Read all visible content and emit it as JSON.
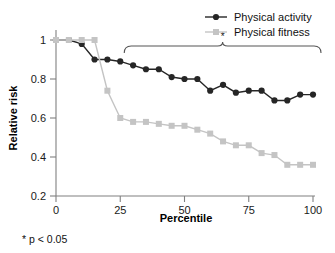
{
  "chart_data": {
    "type": "line",
    "title": "",
    "xlabel": "Percentile",
    "ylabel": "Relative risk",
    "xlim": [
      0,
      100
    ],
    "ylim": [
      0.2,
      1.0
    ],
    "xticks": [
      "0",
      "25",
      "50",
      "75",
      "100"
    ],
    "xtick_values": [
      0,
      25,
      50,
      75,
      100
    ],
    "yticks": [
      "1",
      "0.8",
      "0.6",
      "0.4",
      "0.2"
    ],
    "ytick_values": [
      1,
      0.8,
      0.6,
      0.4,
      0.2
    ],
    "grid": false,
    "legend_position": "top-right",
    "x": [
      0,
      5,
      10,
      15,
      20,
      25,
      30,
      35,
      40,
      45,
      50,
      55,
      60,
      65,
      70,
      75,
      80,
      85,
      90,
      95,
      100
    ],
    "series": [
      {
        "name": "Physical activity",
        "color": "#262626",
        "marker": "circle",
        "values": [
          1.0,
          1.0,
          0.98,
          0.9,
          0.9,
          0.89,
          0.87,
          0.85,
          0.85,
          0.81,
          0.8,
          0.8,
          0.74,
          0.77,
          0.73,
          0.74,
          0.74,
          0.69,
          0.69,
          0.72,
          0.72
        ]
      },
      {
        "name": "Physical fitness",
        "color": "#c4c4c4",
        "marker": "square",
        "values": [
          1.0,
          1.0,
          1.0,
          1.0,
          0.74,
          0.6,
          0.58,
          0.58,
          0.57,
          0.56,
          0.56,
          0.54,
          0.52,
          0.48,
          0.46,
          0.46,
          0.42,
          0.41,
          0.36,
          0.36,
          0.36
        ]
      }
    ],
    "annotations": [
      {
        "name": "significance-bracket",
        "type": "bracket",
        "x_start": 25,
        "x_end": 100,
        "label": "*"
      }
    ],
    "footnote": "* p < 0.05"
  },
  "legend": {
    "items": [
      {
        "label": "Physical activity",
        "color": "#262626",
        "marker": "circle"
      },
      {
        "label": "Physical fitness",
        "color": "#c4c4c4",
        "marker": "square"
      }
    ]
  },
  "axes": {
    "x_title": "Percentile",
    "y_title": "Relative risk"
  },
  "footnote_text": "* p < 0.05",
  "star_symbol": "*"
}
